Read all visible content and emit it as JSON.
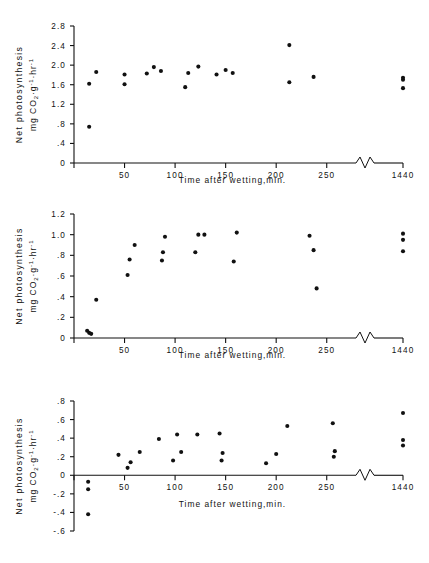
{
  "figure": {
    "background": "#ffffff",
    "ink_color": "#111111",
    "panel_count": 3
  },
  "common": {
    "xlabel": "Time after wetting,min.",
    "ylabel_line1": "Net photosynthesis",
    "ylabel_line2_prefix": "mg CO",
    "ylabel_line2_sub": "2",
    "ylabel_line2_mid": "·g",
    "ylabel_line2_sup1": "-1",
    "ylabel_line2_mid2": "·hr",
    "ylabel_line2_sup2": "-1",
    "x_ticks": [
      "50",
      "100",
      "150",
      "200",
      "250",
      "1440"
    ],
    "axis_break_symbol": "zigzag"
  },
  "chart_data": [
    {
      "type": "scatter",
      "panel": 1,
      "title": "",
      "xlabel": "Time after wetting,min.",
      "ylabel": "Net photosynthesis mg CO2·g-1·hr-1",
      "xlim": [
        0,
        275
      ],
      "ylim": [
        0,
        2.8
      ],
      "y_ticks": [
        "0",
        ".4",
        ".8",
        "1.2",
        "1.6",
        "2.0",
        "2.4",
        "2.8"
      ],
      "y_tick_values": [
        0,
        0.4,
        0.8,
        1.2,
        1.6,
        2.0,
        2.4,
        2.8
      ],
      "x_ticks": [
        "50",
        "100",
        "150",
        "200",
        "250",
        "1440"
      ],
      "x_tick_values": [
        50,
        100,
        150,
        200,
        250,
        1440
      ],
      "axis_break_after": 265,
      "grid": false,
      "legend": "none",
      "points": [
        {
          "x": 15,
          "y": 0.74
        },
        {
          "x": 15,
          "y": 1.62
        },
        {
          "x": 22,
          "y": 1.86
        },
        {
          "x": 50,
          "y": 1.61
        },
        {
          "x": 50,
          "y": 1.81
        },
        {
          "x": 72,
          "y": 1.83
        },
        {
          "x": 79,
          "y": 1.96
        },
        {
          "x": 86,
          "y": 1.88
        },
        {
          "x": 110,
          "y": 1.55
        },
        {
          "x": 113,
          "y": 1.84
        },
        {
          "x": 123,
          "y": 1.97
        },
        {
          "x": 141,
          "y": 1.81
        },
        {
          "x": 150,
          "y": 1.9
        },
        {
          "x": 157,
          "y": 1.84
        },
        {
          "x": 213,
          "y": 2.41
        },
        {
          "x": 213,
          "y": 1.65
        },
        {
          "x": 237,
          "y": 1.76
        },
        {
          "x": 1440,
          "y": 1.74
        },
        {
          "x": 1440,
          "y": 1.7
        },
        {
          "x": 1440,
          "y": 1.53
        }
      ]
    },
    {
      "type": "scatter",
      "panel": 2,
      "title": "",
      "xlabel": "Time after wetting,min.",
      "ylabel": "Net photosynthesis mg CO2·g-1·hr-1",
      "xlim": [
        0,
        275
      ],
      "ylim": [
        0,
        1.2
      ],
      "y_ticks": [
        "0",
        ".2",
        ".4",
        ".6",
        ".8",
        "1.0",
        "1.2"
      ],
      "y_tick_values": [
        0,
        0.2,
        0.4,
        0.6,
        0.8,
        1.0,
        1.2
      ],
      "x_ticks": [
        "50",
        "100",
        "150",
        "200",
        "250",
        "1440"
      ],
      "x_tick_values": [
        50,
        100,
        150,
        200,
        250,
        1440
      ],
      "axis_break_after": 265,
      "grid": false,
      "legend": "none",
      "points": [
        {
          "x": 13,
          "y": 0.07
        },
        {
          "x": 15,
          "y": 0.05
        },
        {
          "x": 17,
          "y": 0.04
        },
        {
          "x": 22,
          "y": 0.37
        },
        {
          "x": 53,
          "y": 0.61
        },
        {
          "x": 55,
          "y": 0.76
        },
        {
          "x": 60,
          "y": 0.9
        },
        {
          "x": 87,
          "y": 0.75
        },
        {
          "x": 88,
          "y": 0.83
        },
        {
          "x": 90,
          "y": 0.98
        },
        {
          "x": 120,
          "y": 0.83
        },
        {
          "x": 123,
          "y": 1.0
        },
        {
          "x": 129,
          "y": 1.0
        },
        {
          "x": 158,
          "y": 0.74
        },
        {
          "x": 161,
          "y": 1.02
        },
        {
          "x": 233,
          "y": 0.99
        },
        {
          "x": 237,
          "y": 0.85
        },
        {
          "x": 240,
          "y": 0.48
        },
        {
          "x": 1440,
          "y": 1.01
        },
        {
          "x": 1440,
          "y": 0.95
        },
        {
          "x": 1440,
          "y": 0.84
        }
      ]
    },
    {
      "type": "scatter",
      "panel": 3,
      "title": "",
      "xlabel": "Time after wetting,min.",
      "ylabel": "Net photosynthesis mg CO2·g-1·hr-1",
      "xlim": [
        0,
        275
      ],
      "ylim": [
        -0.6,
        0.8
      ],
      "y_ticks": [
        "-.6",
        "-.4",
        "-.2",
        "0",
        ".2",
        ".4",
        ".6",
        ".8"
      ],
      "y_tick_values": [
        -0.6,
        -0.4,
        -0.2,
        0,
        0.2,
        0.4,
        0.6,
        0.8
      ],
      "x_ticks": [
        "50",
        "100",
        "150",
        "200",
        "250",
        "1440"
      ],
      "x_tick_values": [
        50,
        100,
        150,
        200,
        250,
        1440
      ],
      "axis_break_after": 265,
      "grid": false,
      "legend": "none",
      "points": [
        {
          "x": 14,
          "y": -0.07
        },
        {
          "x": 14,
          "y": -0.15
        },
        {
          "x": 14,
          "y": -0.42
        },
        {
          "x": 44,
          "y": 0.22
        },
        {
          "x": 53,
          "y": 0.08
        },
        {
          "x": 56,
          "y": 0.14
        },
        {
          "x": 65,
          "y": 0.25
        },
        {
          "x": 84,
          "y": 0.39
        },
        {
          "x": 98,
          "y": 0.16
        },
        {
          "x": 102,
          "y": 0.44
        },
        {
          "x": 106,
          "y": 0.25
        },
        {
          "x": 122,
          "y": 0.44
        },
        {
          "x": 146,
          "y": 0.16
        },
        {
          "x": 147,
          "y": 0.24
        },
        {
          "x": 144,
          "y": 0.45
        },
        {
          "x": 190,
          "y": 0.13
        },
        {
          "x": 200,
          "y": 0.23
        },
        {
          "x": 211,
          "y": 0.53
        },
        {
          "x": 257,
          "y": 0.2
        },
        {
          "x": 258,
          "y": 0.26
        },
        {
          "x": 256,
          "y": 0.56
        },
        {
          "x": 1440,
          "y": 0.67
        },
        {
          "x": 1440,
          "y": 0.38
        },
        {
          "x": 1440,
          "y": 0.32
        }
      ]
    }
  ]
}
